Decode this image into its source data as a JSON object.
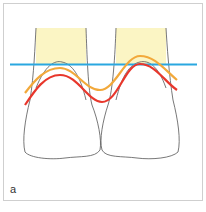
{
  "figure": {
    "panel_label": "a",
    "colors": {
      "frame": "#cfcfcf",
      "root_fill": "#fbf5c4",
      "tooth_outline": "#555555",
      "blue_line": "#2aa7e0",
      "orange_line": "#f2a93b",
      "red_line": "#e8372c"
    },
    "legend": [
      {
        "name": "blue-reference-line",
        "color": "#2aa7e0"
      },
      {
        "name": "orange-gingival-line",
        "color": "#f2a93b"
      },
      {
        "name": "red-gingival-line",
        "color": "#e8372c"
      }
    ]
  }
}
